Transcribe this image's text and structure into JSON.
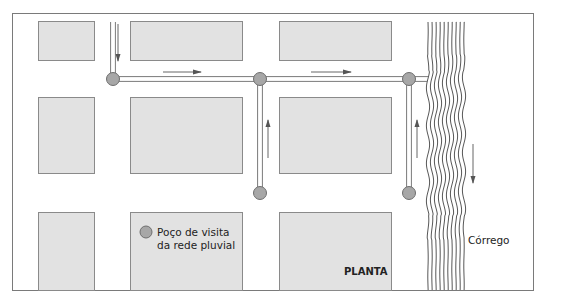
{
  "figure": {
    "view_label": "PLANTA",
    "stream_label": "Córrego",
    "legend": {
      "symbol": "manhole-node",
      "line1": "Poço de visita",
      "line2": "da rede pluvial"
    }
  },
  "colors": {
    "block_fill": "#e2e2e2",
    "block_stroke": "#8a8a8a",
    "node_fill": "#a7a7a7",
    "node_stroke": "#6e6e6e",
    "pipe": "#7a7a7a",
    "arrow": "#555555",
    "stream": "#444444",
    "frame": "#7a7a7a"
  },
  "blocks": [
    {
      "id": "block-r1-c1"
    },
    {
      "id": "block-r1-c2"
    },
    {
      "id": "block-r1-c3"
    },
    {
      "id": "block-r2-c1"
    },
    {
      "id": "block-r2-c2"
    },
    {
      "id": "block-r2-c3"
    },
    {
      "id": "block-r3-c1"
    },
    {
      "id": "block-r3-c2"
    },
    {
      "id": "block-r3-c3"
    }
  ],
  "manholes": [
    {
      "id": "manhole-1"
    },
    {
      "id": "manhole-2"
    },
    {
      "id": "manhole-3"
    },
    {
      "id": "manhole-4"
    },
    {
      "id": "manhole-5"
    }
  ],
  "flow_arrows": [
    {
      "id": "flow-down-inlet",
      "direction": "down"
    },
    {
      "id": "flow-right-1",
      "direction": "right"
    },
    {
      "id": "flow-up-1",
      "direction": "up"
    },
    {
      "id": "flow-right-2",
      "direction": "right"
    },
    {
      "id": "flow-up-2",
      "direction": "up"
    },
    {
      "id": "flow-stream-down",
      "direction": "down"
    }
  ]
}
